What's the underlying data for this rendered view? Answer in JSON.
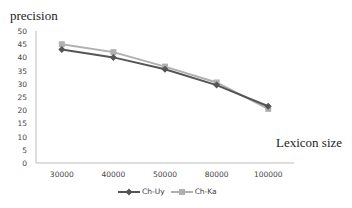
{
  "chart_data": {
    "type": "line",
    "title": "",
    "xlabel": "Lexicon size",
    "ylabel": "precision",
    "categories": [
      "30000",
      "40000",
      "50000",
      "80000",
      "100000"
    ],
    "series": [
      {
        "name": "Ch-Uy",
        "values": [
          43,
          40,
          35.5,
          29.5,
          21.5
        ],
        "color": "#555555",
        "marker": "diamond"
      },
      {
        "name": "Ch-Ka",
        "values": [
          45,
          42,
          36.5,
          30.5,
          20.5
        ],
        "color": "#b0b0b0",
        "marker": "square"
      }
    ],
    "ylim": [
      0,
      50
    ],
    "yticks": [
      "0",
      "5",
      "10",
      "15",
      "20",
      "25",
      "30",
      "35",
      "40",
      "45",
      "50"
    ],
    "grid": false,
    "legend_position": "bottom"
  }
}
